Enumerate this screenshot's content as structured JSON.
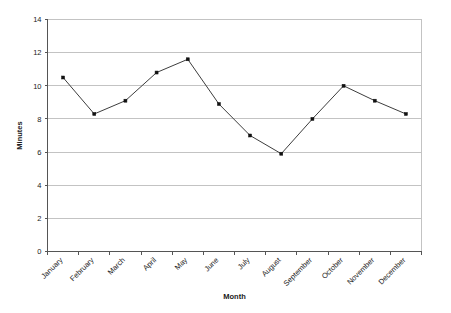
{
  "chart_data": {
    "type": "line",
    "title": "",
    "subtitle": "",
    "xlabel": "Month",
    "ylabel": "Minutes",
    "categories": [
      "January",
      "February",
      "March",
      "April",
      "May",
      "June",
      "July",
      "August",
      "September",
      "October",
      "November",
      "December"
    ],
    "values": [
      10.5,
      8.3,
      9.1,
      10.8,
      11.6,
      8.9,
      7.0,
      5.9,
      8.0,
      10.0,
      9.1,
      8.3
    ],
    "series": [
      {
        "name": "Minutes",
        "values": [
          10.5,
          8.3,
          9.1,
          10.8,
          11.6,
          8.9,
          7.0,
          5.9,
          8.0,
          10.0,
          9.1,
          8.3
        ]
      }
    ],
    "ylim": [
      0,
      14
    ],
    "ytick_values": [
      0,
      2,
      4,
      6,
      8,
      10,
      12,
      14
    ],
    "ytick_labels": [
      "0",
      "2",
      "4",
      "6",
      "8",
      "10",
      "12",
      "14"
    ],
    "grid": {
      "horizontal": true,
      "vertical": false
    },
    "legend": {
      "visible": false,
      "position": "none",
      "entries": []
    },
    "annotations": [],
    "xtick_rotation_degrees": -45,
    "colors": {
      "line": "#3d3d3d",
      "marker": "#111111",
      "gridline": "#c3c3c3",
      "axis": "#555555",
      "plot_background": "#ffffff",
      "text": "#1a1a1a"
    },
    "marker": {
      "shape": "square",
      "size": 3
    }
  }
}
